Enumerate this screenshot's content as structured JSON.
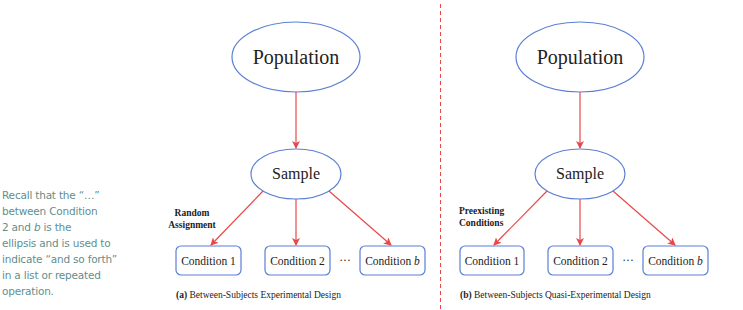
{
  "sidebar_note": {
    "line1": "Recall that the “…”",
    "line2": "between Condition",
    "line3_pre": "2 and ",
    "line3_italic": "b",
    "line3_post": " is the",
    "line4": "ellipsis and is used to",
    "line5": "indicate “and so forth”",
    "line6": "in a list or repeated",
    "line7": "operation."
  },
  "colors": {
    "ellipse_stroke": "#5b7fd6",
    "box_stroke": "#5b7fd6",
    "arrow": "#e8484a",
    "divider": "#e8484a",
    "note_text": "#5f8f8d"
  },
  "panels": [
    {
      "population": "Population",
      "sample": "Sample",
      "assignment_label_1": "Random",
      "assignment_label_2": "Assignment",
      "conditions": [
        "Condition 1",
        "Condition 2",
        "Condition b"
      ],
      "ellipsis": "···",
      "caption_prefix": "(a)",
      "caption": " Between-Subjects Experimental Design"
    },
    {
      "population": "Population",
      "sample": "Sample",
      "assignment_label_1": "Preexisting",
      "assignment_label_2": "Conditions",
      "conditions": [
        "Condition 1",
        "Condition 2",
        "Condition b"
      ],
      "ellipsis": "···",
      "caption_prefix": "(b)",
      "caption": " Between-Subjects Quasi-Experimental Design"
    }
  ]
}
